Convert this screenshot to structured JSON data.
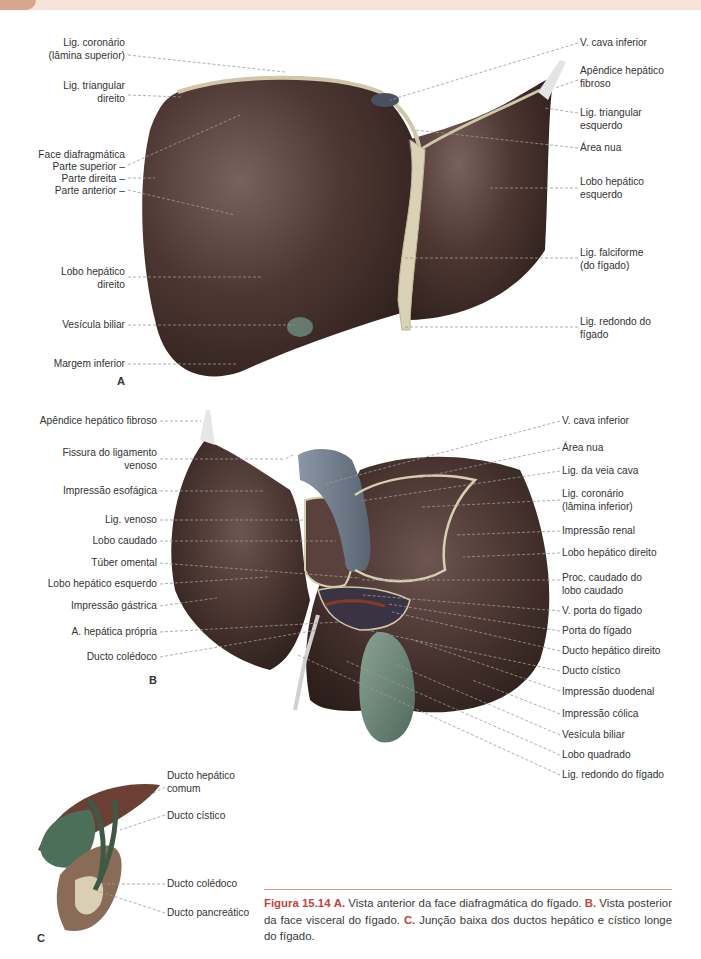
{
  "colors": {
    "header_band": "#f7e2da",
    "header_tab": "#d6a58e",
    "liver": "#4a3430",
    "ligament": "#d9d2b4",
    "gallbladder": "#5d7a6a",
    "vena_cava": "#6d7a8a",
    "accent_red": "#c0463a",
    "leader_line": "#9a9a9a"
  },
  "panel_a": {
    "letter": "A",
    "left_labels": [
      {
        "text": "Lig. coronário\n(lâmina superior)"
      },
      {
        "text": "Lig. triangular\ndireito"
      },
      {
        "text": "Face diafragmática"
      },
      {
        "text": "Parte superior –"
      },
      {
        "text": "Parte direita –"
      },
      {
        "text": "Parte anterior –"
      },
      {
        "text": "Lobo hepático\ndireito"
      },
      {
        "text": "Vesícula biliar"
      },
      {
        "text": "Margem inferior"
      }
    ],
    "right_labels": [
      {
        "text": "V. cava inferior"
      },
      {
        "text": "Apêndice hepático\nfibroso"
      },
      {
        "text": "Lig. triangular\nesquerdo"
      },
      {
        "text": "Área nua"
      },
      {
        "text": "Lobo hepático\nesquerdo"
      },
      {
        "text": "Lig. falciforme\n(do fígado)"
      },
      {
        "text": "Lig. redondo do\nfígado"
      }
    ]
  },
  "panel_b": {
    "letter": "B",
    "left_labels": [
      {
        "text": "Apêndice hepático fibroso"
      },
      {
        "text": "Fissura do ligamento\nvenoso"
      },
      {
        "text": "Impressão esofágica"
      },
      {
        "text": "Lig. venoso"
      },
      {
        "text": "Lobo caudado"
      },
      {
        "text": "Túber omental"
      },
      {
        "text": "Lobo hepático esquerdo"
      },
      {
        "text": "Impressão gástrica"
      },
      {
        "text": "A. hepática própria"
      },
      {
        "text": "Ducto colédoco"
      }
    ],
    "right_labels": [
      {
        "text": "V. cava inferior"
      },
      {
        "text": "Área nua"
      },
      {
        "text": "Lig. da veia cava"
      },
      {
        "text": "Lig. coronário\n(lâmina inferior)"
      },
      {
        "text": "Impressão renal"
      },
      {
        "text": "Lobo hepático direito"
      },
      {
        "text": "Proc. caudado do\nlobo caudado"
      },
      {
        "text": "V. porta do fígado"
      },
      {
        "text": "Porta do fígado"
      },
      {
        "text": "Ducto hepático direito"
      },
      {
        "text": "Ducto cístico"
      },
      {
        "text": "Impressão duodenal"
      },
      {
        "text": "Impressão cólica"
      },
      {
        "text": "Vesícula biliar"
      },
      {
        "text": "Lobo quadrado"
      },
      {
        "text": "Lig. redondo do fígado"
      }
    ]
  },
  "panel_c": {
    "letter": "C",
    "right_labels": [
      {
        "text": "Ducto hepático\ncomum"
      },
      {
        "text": "Ducto cístico"
      },
      {
        "text": "Ducto colédoco"
      },
      {
        "text": "Ducto pancreático"
      }
    ]
  },
  "caption": {
    "figure_label": "Figura 15.14",
    "a_label": "A.",
    "a_text": " Vista anterior da face diafragmática do fígado. ",
    "b_label": "B.",
    "b_text": " Vista posterior da face visceral do fígado. ",
    "c_label": "C.",
    "c_text": " Junção baixa dos ductos hepático e cístico longe do fígado."
  }
}
